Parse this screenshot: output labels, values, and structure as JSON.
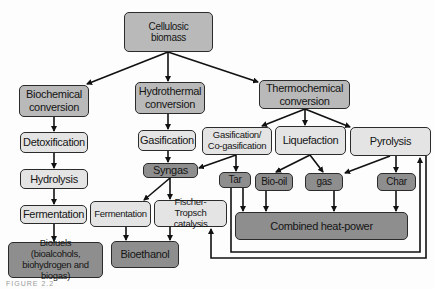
{
  "diagram": {
    "root": "Cellulosic biomass",
    "routes": {
      "biochemical": "Biochemical conversion",
      "hydrothermal": "Hydrothermal conversion",
      "thermochemical": "Thermochemical conversion"
    },
    "biochemical_steps": [
      "Detoxification",
      "Hydrolysis",
      "Fermentation"
    ],
    "biofuels": "Biofuels (bioalcohols, biohydrogen and biogas)",
    "hydrothermal_steps": {
      "gasification": "Gasification",
      "syngas": "Syngas",
      "fermentation": "Fermentation",
      "fischer_tropsch": "Fischer-Tropsch catalysis",
      "bioethanol": "Bioethanol"
    },
    "thermochemical_steps": {
      "gasification_co": "Gasification/ Co-gasification",
      "liquefaction": "Liquefaction",
      "pyrolysis": "Pyrolysis"
    },
    "products": {
      "tar": "Tar",
      "bio_oil": "Bio-oil",
      "gas": "gas",
      "char": "Char"
    },
    "chp": "Combined heat-power",
    "caption": "FIGURE 2.2",
    "colors": {
      "dark_fill": "#8e8e8e",
      "mid_fill": "#b9b9b9",
      "light_fill": "#e4e4e4",
      "stroke": "#111111"
    }
  }
}
